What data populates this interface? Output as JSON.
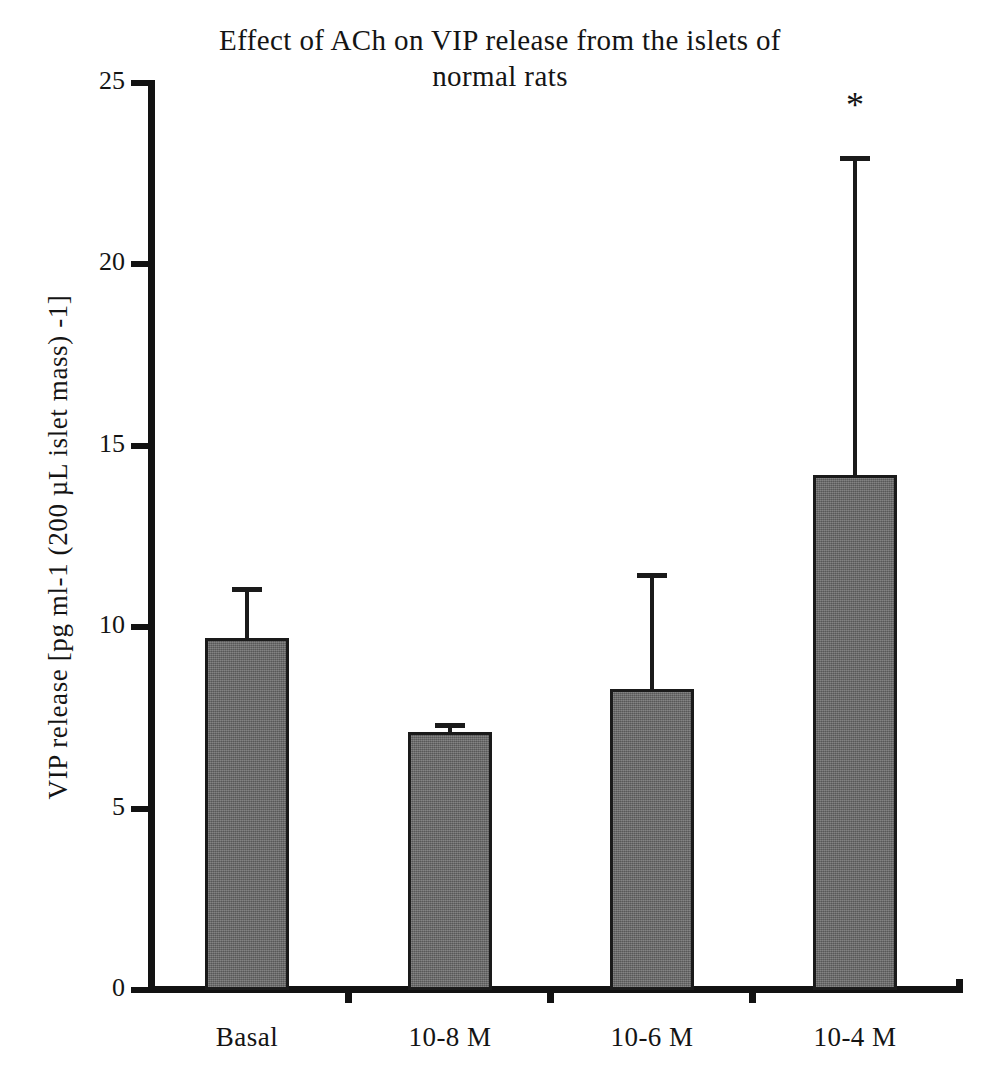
{
  "chart_data": {
    "type": "bar",
    "title": "Effect of ACh on VIP release from the islets of\nnormal rats",
    "xlabel": "",
    "ylabel": "VIP release [pg ml-1 (200 µL islet mass) -1]",
    "categories": [
      "Basal",
      "10-8 M",
      "10-6 M",
      "10-4 M"
    ],
    "values": [
      9.7,
      7.1,
      8.3,
      14.2
    ],
    "errors": [
      1.4,
      0.25,
      3.2,
      8.8
    ],
    "error_tops": [
      11.1,
      7.35,
      11.5,
      23.0
    ],
    "ylim": [
      0,
      25
    ],
    "yticks": [
      0,
      5,
      10,
      15,
      20,
      25
    ],
    "ytick_labels": [
      "0",
      "5",
      "10",
      "15",
      "20",
      "25"
    ],
    "grid": false,
    "legend": "none",
    "annotations": [
      {
        "text": "*",
        "category": "10-4 M",
        "y": 24.4,
        "meaning": "significant"
      }
    ],
    "bar_color": "#6a6a6a",
    "bar_edge_color": "#1a1a1a",
    "axis_color": "#121212",
    "background_color": "#ffffff"
  }
}
